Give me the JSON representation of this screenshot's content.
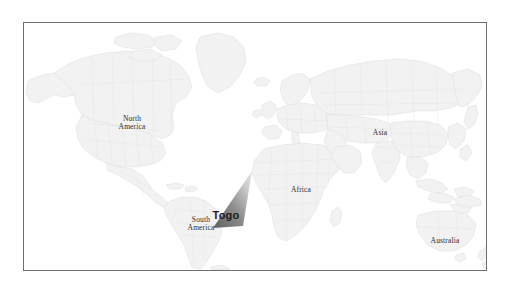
{
  "figure": {
    "kind": "world-map",
    "background_color": "#ffffff",
    "frame": {
      "border_color": "#6e6e70",
      "border_width_px": 1,
      "x": 23,
      "y": 22,
      "width": 464,
      "height": 249
    },
    "colors": {
      "ocean": "#ffffff",
      "land_fill": "#f2f2f2",
      "land_stroke": "#dcdcdc",
      "country_border": "#e2e2e2",
      "graticule": "#ededed",
      "label_text": "#2b2b2b",
      "callout_text": "#1c1c1c",
      "callout_dark": "#636363",
      "callout_light": "#d9d9d9"
    }
  },
  "map": {
    "labels": [
      {
        "id": "north-america",
        "text": "North\nAmerica",
        "x": 108,
        "y": 100
      },
      {
        "id": "south-america",
        "text": "South\nAmerica",
        "x": 177,
        "y": 201
      },
      {
        "id": "africa",
        "text": "Africa",
        "x": 277,
        "y": 167
      },
      {
        "id": "asia",
        "text": "Asia",
        "x": 356,
        "y": 110
      },
      {
        "id": "australia",
        "text": "Australia",
        "x": 421,
        "y": 218
      }
    ]
  },
  "callout": {
    "label": "Togo",
    "label_x": 226,
    "label_y": 215,
    "pointer_tip_x": 252,
    "pointer_tip_y": 171,
    "pointer_base_left_x": 213,
    "pointer_base_left_y": 228,
    "pointer_base_right_x": 243,
    "pointer_base_right_y": 226,
    "gradient_from": "#636363",
    "gradient_to": "#d9d9d9"
  }
}
